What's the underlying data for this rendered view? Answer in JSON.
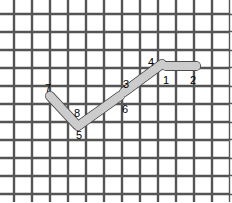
{
  "figure": {
    "width": 232,
    "height": 202,
    "background_color": "#ffffff"
  },
  "weave": {
    "description": "basket / plain weave of horizontal and vertical strips",
    "strip_fill": "#ffffff",
    "strip_edge_light": "#c8c8c8",
    "strip_edge_dark": "#555555",
    "cell_size": 18,
    "strip_length": 36,
    "columns": 13,
    "rows": 12,
    "origin_x": -4,
    "origin_y": -4
  },
  "path": {
    "stroke_color": "#4d4d4d",
    "fill_color": "#cccccc",
    "stroke_width": 1,
    "thickness": 8,
    "vertices": [
      {
        "id": "2",
        "x": 196,
        "y": 66,
        "label": "2",
        "label_x": 190,
        "label_y": 84
      },
      {
        "id": "1",
        "x": 166,
        "y": 66,
        "label": "1",
        "label_x": 163,
        "label_y": 84
      },
      {
        "id": "4",
        "x": 162,
        "y": 64,
        "label": "4",
        "label_x": 148,
        "label_y": 66
      },
      {
        "id": "3",
        "x": 124,
        "y": 92,
        "label": "3",
        "label_x": 123,
        "label_y": 88
      },
      {
        "id": "6",
        "x": 120,
        "y": 96,
        "label": "6",
        "label_x": 122,
        "label_y": 113
      },
      {
        "id": "5",
        "x": 78,
        "y": 126,
        "label": "5",
        "label_x": 76,
        "label_y": 139
      },
      {
        "id": "8",
        "x": 76,
        "y": 124,
        "label": "8",
        "label_x": 74,
        "label_y": 117
      },
      {
        "id": "7",
        "x": 50,
        "y": 96,
        "label": "7",
        "label_x": 45,
        "label_y": 92
      }
    ],
    "segments": [
      {
        "name": "segment-1-2",
        "from": "1",
        "to": "2"
      },
      {
        "name": "segment-3-4",
        "from": "3",
        "to": "4"
      },
      {
        "name": "segment-5-6",
        "from": "5",
        "to": "6"
      },
      {
        "name": "segment-7-8",
        "from": "7",
        "to": "8"
      }
    ],
    "labels": [
      "1",
      "2",
      "3",
      "4",
      "5",
      "6",
      "7",
      "8"
    ]
  }
}
